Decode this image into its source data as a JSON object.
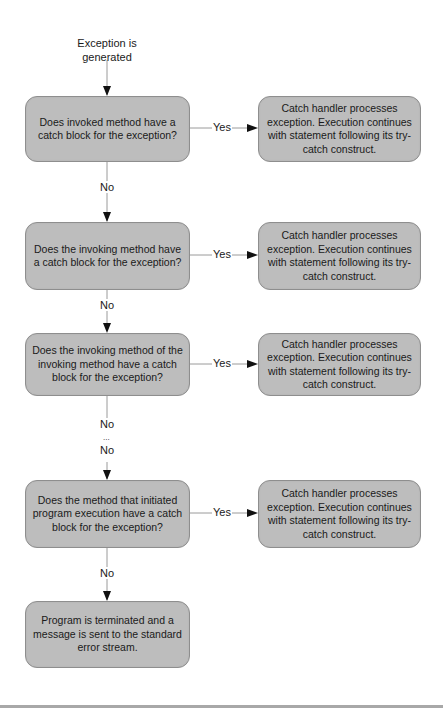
{
  "header": {
    "fragment_left": "",
    "fragment_right": ""
  },
  "diagram": {
    "type": "flowchart",
    "start_label": "Exception is generated",
    "decisions": [
      {
        "id": "d1",
        "text": "Does invoked method have a catch block for the exception?"
      },
      {
        "id": "d2",
        "text": "Does the invoking method have a catch block for the exception?"
      },
      {
        "id": "d3",
        "text": "Does the invoking method  of the invoking method have a catch block for the exception?"
      },
      {
        "id": "d4",
        "text": "Does the method that initiated program execution have a catch block for the exception?"
      }
    ],
    "actions": [
      {
        "id": "a1",
        "text": "Catch handler processes exception. Execution continues with statement following its try-catch construct."
      },
      {
        "id": "a2",
        "text": "Catch handler processes exception. Execution continues with statement following its try-catch construct."
      },
      {
        "id": "a3",
        "text": "Catch handler processes exception. Execution continues with statement following its try-catch construct."
      },
      {
        "id": "a4",
        "text": "Catch handler processes exception. Execution continues with statement following its try-catch construct."
      }
    ],
    "terminal": {
      "id": "t1",
      "text": "Program is terminated and a message is sent to the standard error stream."
    },
    "edge_labels": {
      "yes": "Yes",
      "no": "No",
      "ellipsis": "..."
    },
    "colors": {
      "box_fill": "#bdbdbd",
      "box_border": "#8e8e8e",
      "line": "#9a9a9a",
      "arrowhead": "#111111"
    }
  }
}
